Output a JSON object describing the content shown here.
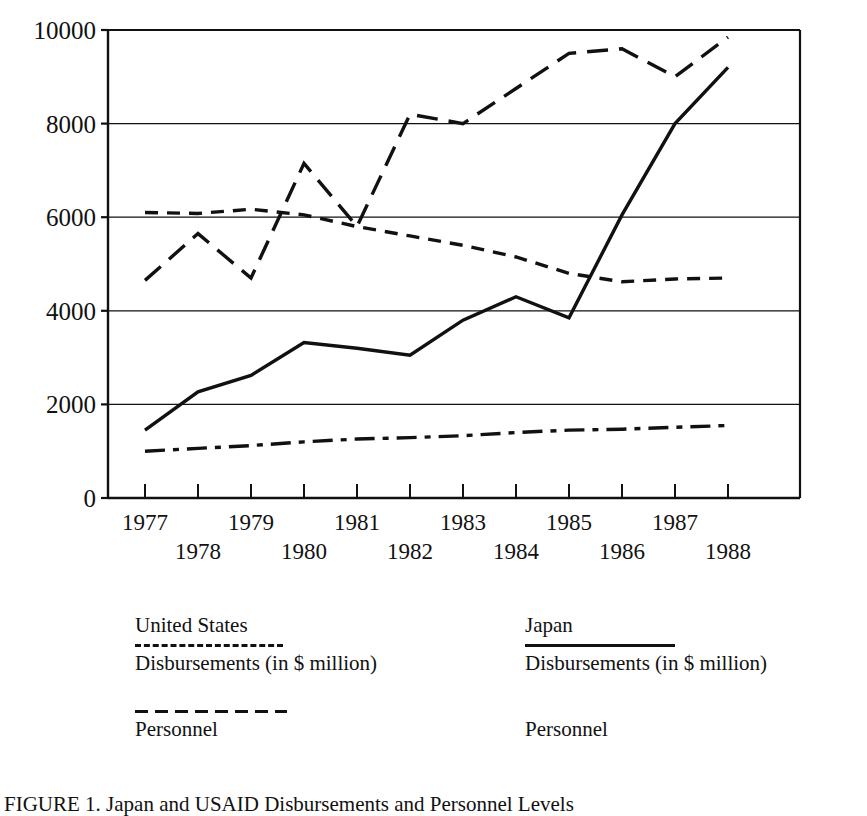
{
  "figure": {
    "caption": "FIGURE 1. Japan and USAID Disbursements and Personnel Levels"
  },
  "axes": {
    "xlabel": "Year",
    "ylabel": "",
    "y_ticks": [
      "0",
      "2000",
      "4000",
      "6000",
      "8000",
      "10000"
    ],
    "x_ticks": [
      "1977",
      "1978",
      "1979",
      "1980",
      "1981",
      "1982",
      "1983",
      "1984",
      "1985",
      "1986",
      "1987",
      "1988"
    ]
  },
  "legend": {
    "columns": [
      {
        "header": "United States",
        "entries": [
          {
            "label": "Disbursements (in $ million)",
            "style": "shortdash"
          },
          {
            "label": "Personnel",
            "style": "longdash"
          }
        ]
      },
      {
        "header": "Japan",
        "entries": [
          {
            "label": "Disbursements (in $ million)",
            "style": "solid"
          },
          {
            "label": "Personnel",
            "style": "blank"
          }
        ]
      }
    ]
  },
  "chart_data": {
    "type": "line",
    "title": "",
    "xlabel": "Year",
    "ylabel": "",
    "xlim": [
      1976.5,
      1988.5
    ],
    "ylim": [
      0,
      10000
    ],
    "grid": true,
    "grid_values": [
      2000,
      4000,
      6000,
      8000,
      10000
    ],
    "legend_position": "below-plot",
    "x": [
      1977,
      1978,
      1979,
      1980,
      1981,
      1982,
      1983,
      1984,
      1985,
      1986,
      1987,
      1988
    ],
    "series": [
      {
        "name": "Japan Disbursements (in $ million)",
        "country": "Japan",
        "metric": "Disbursements (in $ million)",
        "style": "long-dash",
        "values": [
          4650,
          5650,
          4700,
          7150,
          5800,
          8200,
          8000,
          8750,
          9500,
          9600,
          9000,
          9850
        ]
      },
      {
        "name": "United States Disbursements (in $ million)",
        "country": "United States",
        "metric": "Disbursements (in $ million)",
        "style": "short-dash",
        "values": [
          6100,
          6080,
          6170,
          6050,
          5800,
          5600,
          5400,
          5150,
          4800,
          4620,
          4680,
          4700
        ]
      },
      {
        "name": "Japan Personnel",
        "country": "Japan",
        "metric": "Personnel",
        "style": "solid",
        "values": [
          1450,
          2270,
          2620,
          3320,
          3200,
          3050,
          3800,
          4300,
          3850,
          6050,
          8000,
          9200
        ]
      },
      {
        "name": "United States Personnel",
        "country": "United States",
        "metric": "Personnel",
        "style": "dash-dot",
        "values": [
          1000,
          1060,
          1120,
          1200,
          1260,
          1290,
          1330,
          1400,
          1450,
          1470,
          1510,
          1550
        ]
      }
    ]
  }
}
